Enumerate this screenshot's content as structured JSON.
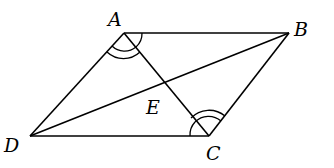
{
  "diagram": {
    "type": "parallelogram-with-diagonals",
    "points": {
      "A": {
        "label": "A",
        "x": 124,
        "y": 33
      },
      "B": {
        "label": "B",
        "x": 289,
        "y": 33
      },
      "C": {
        "label": "C",
        "x": 209,
        "y": 136
      },
      "D": {
        "label": "D",
        "x": 30,
        "y": 136
      },
      "E": {
        "label": "E",
        "x": 164,
        "y": 83
      }
    },
    "segments": [
      "AB",
      "BC",
      "CD",
      "DA",
      "AC",
      "BD"
    ],
    "angle_marks": [
      {
        "vertex": "A",
        "angle": "DAC",
        "arcs": 2
      },
      {
        "vertex": "C",
        "angle": "ACD... (BCA, marked)",
        "arcs": 2
      }
    ],
    "labels": {
      "A": "A",
      "B": "B",
      "C": "C",
      "D": "D",
      "E": "E"
    }
  }
}
